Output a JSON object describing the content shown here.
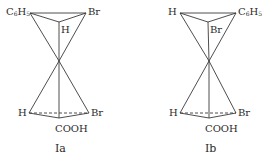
{
  "diagram": {
    "type": "stereochemical projection (two tetrahedra joined at a point)",
    "structures": [
      {
        "id": "Ia",
        "caption": "Ia",
        "top": {
          "left": {
            "text": "C",
            "sub": "6",
            "text2": "H",
            "sub2": "5"
          },
          "right": "Br",
          "back": "H"
        },
        "bottom": {
          "left": "H",
          "right": "Br",
          "front": "COOH"
        }
      },
      {
        "id": "Ib",
        "caption": "Ib",
        "top": {
          "left": "H",
          "right": {
            "text": "C",
            "sub": "6",
            "text2": "H",
            "sub2": "5"
          },
          "back": "Br"
        },
        "bottom": {
          "left": "H",
          "right": "Br",
          "front": "COOH"
        }
      }
    ],
    "colors": {
      "line": "#3a3a3a",
      "text": "#2a2a2a",
      "background": "#ffffff"
    }
  }
}
